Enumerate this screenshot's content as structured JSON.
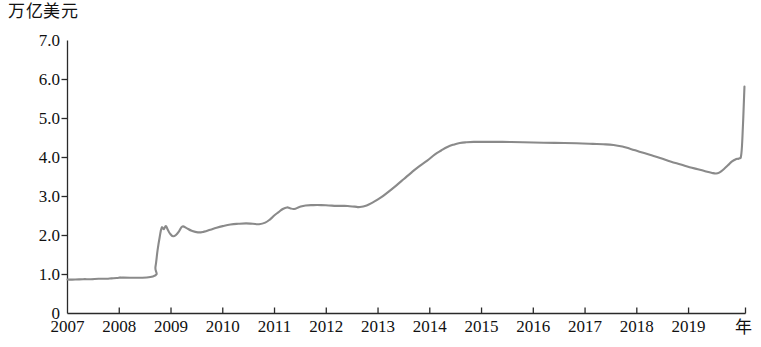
{
  "chart_data": {
    "type": "line",
    "title": "",
    "subtitle": "",
    "ylabel": "万亿美元",
    "xlabel": "年",
    "ylim": [
      0,
      7.0
    ],
    "xlim": [
      2007,
      2020.1
    ],
    "grid": false,
    "legend": null,
    "line_color": "#8a8a8a",
    "axis_color": "#2a2a2a",
    "y_ticks": [
      "7.0",
      "6.0",
      "5.0",
      "4.0",
      "3.0",
      "2.0",
      "1.0",
      "0"
    ],
    "y_tick_values": [
      7.0,
      6.0,
      5.0,
      4.0,
      3.0,
      2.0,
      1.0,
      0
    ],
    "x_ticks": [
      "2007",
      "2008",
      "2009",
      "2010",
      "2011",
      "2012",
      "2013",
      "2014",
      "2015",
      "2016",
      "2017",
      "2018",
      "2019"
    ],
    "x_tick_values": [
      2007,
      2008,
      2009,
      2010,
      2011,
      2012,
      2013,
      2014,
      2015,
      2016,
      2017,
      2018,
      2019
    ],
    "series": [
      {
        "name": "",
        "x": [
          2007.0,
          2007.15,
          2007.3,
          2007.45,
          2007.6,
          2007.75,
          2007.85,
          2007.95,
          2008.02,
          2008.05,
          2008.65,
          2008.7,
          2008.74,
          2008.78,
          2008.82,
          2008.86,
          2008.9,
          2008.94,
          2008.98,
          2009.04,
          2009.1,
          2009.16,
          2009.22,
          2009.3,
          2009.4,
          2009.52,
          2009.64,
          2009.76,
          2009.88,
          2010.0,
          2010.15,
          2010.3,
          2010.45,
          2010.58,
          2010.7,
          2010.82,
          2010.92,
          2011.0,
          2011.08,
          2011.16,
          2011.24,
          2011.3,
          2011.38,
          2011.48,
          2011.6,
          2011.75,
          2011.9,
          2012.05,
          2012.2,
          2012.35,
          2012.45,
          2012.55,
          2012.65,
          2012.78,
          2012.9,
          2013.05,
          2013.2,
          2013.35,
          2013.5,
          2013.65,
          2013.8,
          2013.95,
          2014.1,
          2014.22,
          2014.34,
          2014.46,
          2014.58,
          2014.7,
          2014.85,
          2015.1,
          2015.4,
          2015.8,
          2016.2,
          2016.6,
          2016.95,
          2017.15,
          2017.35,
          2017.55,
          2017.72,
          2017.88,
          2018.05,
          2018.25,
          2018.45,
          2018.65,
          2018.85,
          2019.02,
          2019.18,
          2019.32,
          2019.44,
          2019.53,
          2019.6,
          2019.68,
          2019.76,
          2019.84,
          2019.92,
          2019.98,
          2020.02,
          2020.05,
          2020.08
        ],
        "y": [
          0.87,
          0.87,
          0.88,
          0.88,
          0.89,
          0.89,
          0.9,
          0.91,
          0.92,
          0.92,
          0.95,
          1.2,
          1.62,
          1.95,
          2.2,
          2.16,
          2.24,
          2.14,
          2.05,
          1.98,
          2.02,
          2.12,
          2.23,
          2.19,
          2.12,
          2.08,
          2.1,
          2.15,
          2.2,
          2.24,
          2.28,
          2.3,
          2.31,
          2.3,
          2.29,
          2.33,
          2.42,
          2.52,
          2.6,
          2.68,
          2.72,
          2.7,
          2.68,
          2.73,
          2.77,
          2.78,
          2.78,
          2.77,
          2.76,
          2.76,
          2.75,
          2.74,
          2.73,
          2.77,
          2.85,
          2.97,
          3.12,
          3.28,
          3.45,
          3.62,
          3.78,
          3.92,
          4.08,
          4.18,
          4.27,
          4.33,
          4.37,
          4.39,
          4.4,
          4.4,
          4.4,
          4.39,
          4.38,
          4.37,
          4.36,
          4.35,
          4.34,
          4.32,
          4.28,
          4.22,
          4.15,
          4.07,
          3.99,
          3.9,
          3.82,
          3.75,
          3.7,
          3.65,
          3.61,
          3.59,
          3.62,
          3.7,
          3.8,
          3.9,
          3.96,
          3.98,
          4.1,
          4.8,
          5.82
        ]
      }
    ]
  },
  "axis": {
    "y_title": "万亿美元",
    "x_title": "年"
  }
}
